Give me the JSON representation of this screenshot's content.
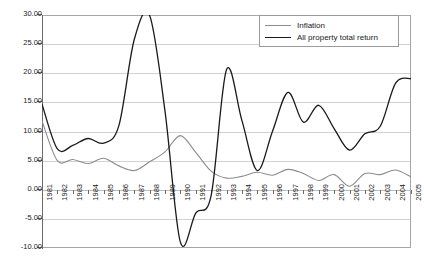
{
  "chart_data": {
    "type": "line",
    "title": "",
    "xlabel": "",
    "ylabel": "",
    "grid": true,
    "legend_position": "top-right-inside",
    "ylim": [
      -10.0,
      30.0
    ],
    "ytick_labels": [
      "30.00",
      "25.00",
      "20.00",
      "15.00",
      "10.00",
      "5.00",
      "0.00",
      "-5.00",
      "-10.00"
    ],
    "ytick_values": [
      30,
      25,
      20,
      15,
      10,
      5,
      0,
      -5,
      -10
    ],
    "categories": [
      "1981",
      "1982",
      "1983",
      "1984",
      "1985",
      "1986",
      "1987",
      "1988",
      "1989",
      "1990",
      "1991",
      "1992",
      "1993",
      "1994",
      "1995",
      "1996",
      "1997",
      "1998",
      "1999",
      "2000",
      "2001",
      "2002",
      "2003",
      "2004",
      "2005"
    ],
    "series": [
      {
        "name": "Inflation",
        "color": "#8c8c8c",
        "values": [
          11.8,
          5.0,
          5.2,
          4.5,
          5.4,
          4.1,
          3.3,
          4.8,
          6.5,
          9.3,
          6.4,
          3.2,
          2.0,
          2.3,
          3.0,
          2.5,
          3.5,
          2.8,
          1.6,
          2.6,
          0.6,
          2.8,
          2.6,
          3.4,
          2.2
        ]
      },
      {
        "name": "All property total return",
        "color": "#1a1a1a",
        "values": [
          14.7,
          7.0,
          7.6,
          8.8,
          8.0,
          11.0,
          25.8,
          29.9,
          13.5,
          -9.0,
          -4.0,
          -1.0,
          20.6,
          11.9,
          3.3,
          10.1,
          16.7,
          11.6,
          14.5,
          10.5,
          6.8,
          9.6,
          10.9,
          18.3,
          19.1
        ]
      }
    ]
  },
  "legend": {
    "items": [
      {
        "label": "Inflation"
      },
      {
        "label": "All property total return"
      }
    ]
  }
}
